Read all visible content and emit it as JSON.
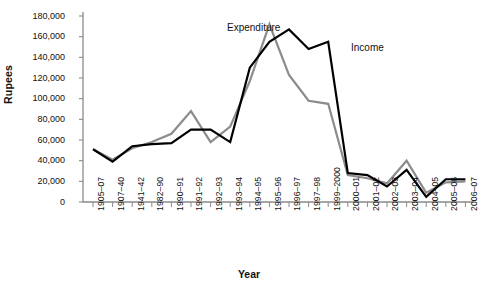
{
  "chart_data": {
    "type": "line",
    "title": "",
    "xlabel": "Year",
    "ylabel": "Rupees",
    "ylim": [
      0,
      180000
    ],
    "ytick_step": 20000,
    "ytick_labels": [
      "0",
      "20,000",
      "40,000",
      "60,000",
      "80,000",
      "100,000",
      "120,000",
      "140,000",
      "160,000",
      "180,000"
    ],
    "ytick_values": [
      0,
      20000,
      40000,
      60000,
      80000,
      100000,
      120000,
      140000,
      160000,
      180000
    ],
    "grid": false,
    "legend_position": "inline-annotations",
    "categories": [
      "1905–07",
      "1907–40",
      "1941–42",
      "1982–90",
      "1990–91",
      "1991–92",
      "1992–93",
      "1993–94",
      "1994–95",
      "1995–96",
      "1996–97",
      "1997–98",
      "1999–2000",
      "2000–01",
      "2001–02",
      "2002–03",
      "2003–04",
      "2004–05",
      "2005–06",
      "2006–07"
    ],
    "series": [
      {
        "name": "Expenditure",
        "color": "#8c8c8c",
        "values": [
          51000,
          41000,
          52000,
          58000,
          66000,
          88000,
          58000,
          73000,
          117000,
          172000,
          123000,
          98000,
          95000,
          26000,
          23000,
          18000,
          40000,
          9000,
          19000,
          20000
        ]
      },
      {
        "name": "Income",
        "color": "#000000",
        "values": [
          51000,
          39000,
          54000,
          56000,
          57000,
          70000,
          70000,
          58000,
          130000,
          155000,
          167000,
          148000,
          155000,
          28000,
          26000,
          15000,
          31000,
          5000,
          22000,
          22000
        ]
      }
    ],
    "annotations": [
      {
        "text": "Expenditure",
        "x_frac": 0.455,
        "y_px": 22
      },
      {
        "text": "Income",
        "x_frac": 0.705,
        "y_px": 42
      }
    ]
  }
}
